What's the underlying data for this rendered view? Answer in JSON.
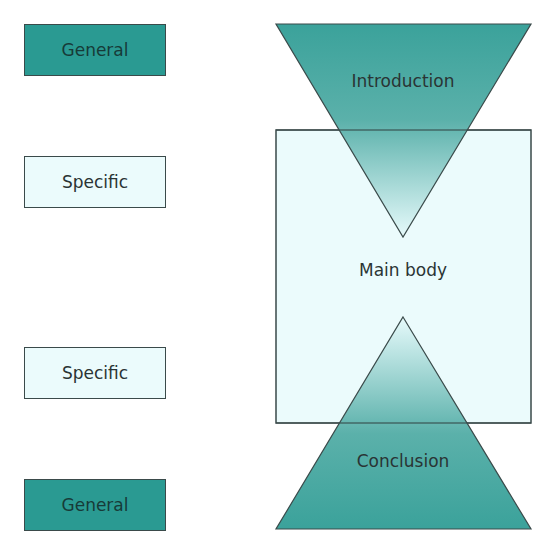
{
  "left_labels": [
    {
      "text": "General",
      "style": "dark"
    },
    {
      "text": "Specific",
      "style": "light"
    },
    {
      "text": "Specific",
      "style": "light"
    },
    {
      "text": "General",
      "style": "dark"
    }
  ],
  "diagram": {
    "introduction": "Introduction",
    "main_body": "Main body",
    "conclusion": "Conclusion"
  },
  "colors": {
    "teal": "#2a9a92",
    "light": "#ebfbfc",
    "border": "#3a4a4a"
  }
}
